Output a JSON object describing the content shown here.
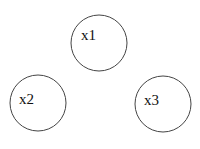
{
  "diagram": {
    "nodes": [
      {
        "id": "x1",
        "label": "x1",
        "cx": 99,
        "cy": 43,
        "r": 28,
        "label_x": 81,
        "label_y": 40
      },
      {
        "id": "x2",
        "label": "x2",
        "cx": 38,
        "cy": 103,
        "r": 28,
        "label_x": 19,
        "label_y": 104
      },
      {
        "id": "x3",
        "label": "x3",
        "cx": 163,
        "cy": 104,
        "r": 28,
        "label_x": 144,
        "label_y": 105
      }
    ],
    "stroke_color": "#444444",
    "background": "#ffffff"
  }
}
